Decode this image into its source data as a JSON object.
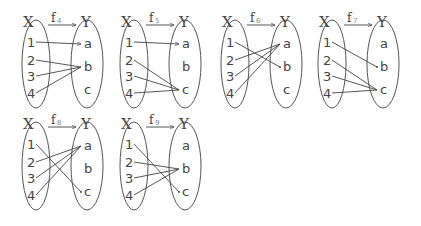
{
  "diagrams": [
    {
      "name": "f",
      "sub": "4",
      "domain_label": "X",
      "codomain_label": "Y",
      "domain": [
        "1",
        "2",
        "3",
        "4"
      ],
      "codomain": [
        "a",
        "b",
        "c"
      ],
      "mapping": {
        "1": "a",
        "2": "b",
        "3": "b",
        "4": "b"
      }
    },
    {
      "name": "f",
      "sub": "5",
      "domain_label": "X",
      "codomain_label": "Y",
      "domain": [
        "1",
        "2",
        "3",
        "4"
      ],
      "codomain": [
        "a",
        "b",
        "c"
      ],
      "mapping": {
        "1": "a",
        "2": "c",
        "3": "c",
        "4": "c"
      }
    },
    {
      "name": "f",
      "sub": "6",
      "domain_label": "X",
      "codomain_label": "Y",
      "domain": [
        "1",
        "2",
        "3",
        "4"
      ],
      "codomain": [
        "a",
        "b",
        "c"
      ],
      "mapping": {
        "1": "b",
        "2": "a",
        "3": "a",
        "4": "a"
      }
    },
    {
      "name": "f",
      "sub": "7",
      "domain_label": "X",
      "codomain_label": "Y",
      "domain": [
        "1",
        "2",
        "3",
        "4"
      ],
      "codomain": [
        "a",
        "b",
        "c"
      ],
      "mapping": {
        "1": "b",
        "2": "c",
        "3": "c",
        "4": "c"
      }
    },
    {
      "name": "f",
      "sub": "8",
      "domain_label": "X",
      "codomain_label": "Y",
      "domain": [
        "1",
        "2",
        "3",
        "4"
      ],
      "codomain": [
        "a",
        "b",
        "c"
      ],
      "mapping": {
        "1": "c",
        "2": "a",
        "3": "a",
        "4": "a"
      }
    },
    {
      "name": "f",
      "sub": "9",
      "domain_label": "X",
      "codomain_label": "Y",
      "domain": [
        "1",
        "2",
        "3",
        "4"
      ],
      "codomain": [
        "a",
        "b",
        "c"
      ],
      "mapping": {
        "1": "c",
        "2": "b",
        "3": "b",
        "4": "b"
      }
    }
  ],
  "layout_origins": [
    [
      22,
      10
    ],
    [
      120,
      10
    ],
    [
      221,
      10
    ],
    [
      318,
      10
    ],
    [
      22,
      112
    ],
    [
      120,
      112
    ]
  ]
}
